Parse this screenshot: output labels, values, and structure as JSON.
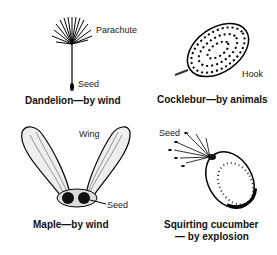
{
  "panels": [
    {
      "id": "dandelion",
      "caption": "Dandelion—by wind",
      "labels": {
        "top": "Parachute",
        "bottom": "Seed"
      }
    },
    {
      "id": "cocklebur",
      "caption": "Cocklebur—by animals",
      "labels": {
        "side": "Hook"
      }
    },
    {
      "id": "maple",
      "caption": "Maple—by wind",
      "labels": {
        "top": "Wing",
        "bottom": "Seed"
      }
    },
    {
      "id": "cucumber",
      "caption_line1": "Squirting cucumber",
      "caption_line2": "— by explosion",
      "labels": {
        "top": "Seed"
      }
    }
  ]
}
